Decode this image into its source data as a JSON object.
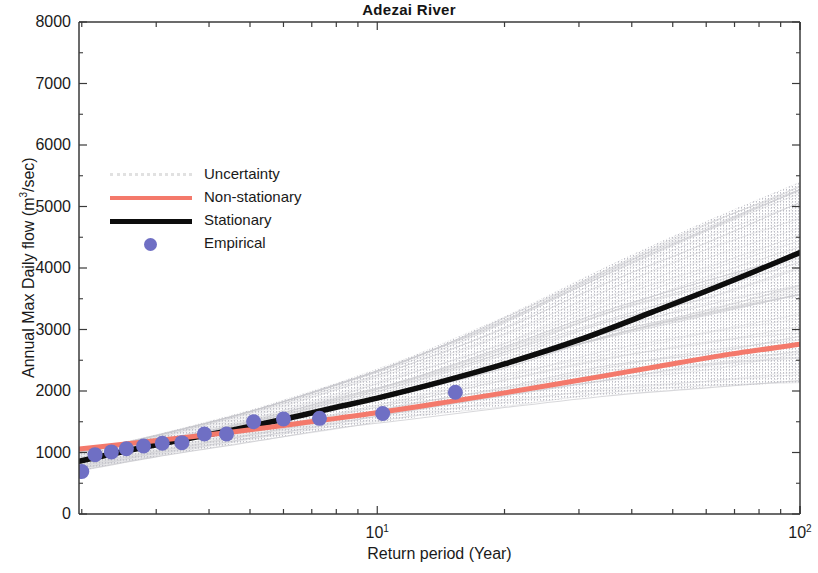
{
  "chart_data": {
    "type": "line",
    "title": "Adezai  River",
    "xlabel": "Return period (Year)",
    "ylabel_parts": {
      "pre": "Annual Max  Daily flow (m",
      "sup": "3",
      "post": "/sec)"
    },
    "ylabel": "Annual Max  Daily flow (m3/sec)",
    "xscale": "log",
    "yscale": "linear",
    "xlim": [
      1.97,
      100
    ],
    "ylim": [
      0,
      8000
    ],
    "ytick_labels": [
      "8000",
      "7000",
      "6000",
      "5000",
      "4000",
      "3000",
      "2000",
      "1000",
      "0"
    ],
    "ytick_values": [
      8000,
      7000,
      6000,
      5000,
      4000,
      3000,
      2000,
      1000,
      0
    ],
    "xtick_labels": [
      "10",
      "10"
    ],
    "xtick_exponents": [
      "1",
      "2"
    ],
    "xtick_values": [
      10,
      100
    ],
    "grid": false,
    "legend_position": "upper left inside",
    "legend": [
      {
        "label": "Uncertainty",
        "style": "stipple",
        "color": "#c9c9c9"
      },
      {
        "label": "Non-stationary",
        "style": "line",
        "color": "#f4796b"
      },
      {
        "label": "Stationary",
        "style": "line",
        "color": "#0d0d0d"
      },
      {
        "label": "Empirical",
        "style": "marker",
        "color": "#6f6fc4"
      }
    ],
    "colors": {
      "non_stationary": "#f4796b",
      "stationary": "#0d0d0d",
      "empirical": "#6f6fc4",
      "uncertainty": "#c7c7cc",
      "axis": "#3a3a3a",
      "text": "#1a1a1a"
    },
    "series": [
      {
        "name": "Non-stationary",
        "type": "line",
        "color": "#f4796b",
        "x": [
          1.97,
          2.3,
          2.8,
          3.5,
          4.5,
          6,
          8,
          10,
          14,
          20,
          30,
          45,
          65,
          100
        ],
        "y": [
          1055,
          1105,
          1170,
          1245,
          1330,
          1440,
          1555,
          1645,
          1800,
          1970,
          2175,
          2385,
          2575,
          2760
        ]
      },
      {
        "name": "Stationary",
        "type": "line",
        "color": "#0d0d0d",
        "x": [
          1.97,
          2.3,
          2.8,
          3.5,
          4.5,
          6,
          8,
          10,
          14,
          20,
          30,
          45,
          65,
          100
        ],
        "y": [
          855,
          960,
          1085,
          1215,
          1360,
          1540,
          1735,
          1885,
          2140,
          2440,
          2830,
          3290,
          3720,
          4250
        ]
      },
      {
        "name": "Empirical",
        "type": "scatter",
        "color": "#6f6fc4",
        "x": [
          2.0,
          2.15,
          2.35,
          2.55,
          2.8,
          3.1,
          3.45,
          3.9,
          4.4,
          5.1,
          6.0,
          7.3,
          10.3,
          15.3
        ],
        "y": [
          690,
          965,
          1010,
          1060,
          1105,
          1150,
          1160,
          1300,
          1300,
          1500,
          1545,
          1555,
          1635,
          1980
        ]
      },
      {
        "name": "Uncertainty",
        "type": "band",
        "color": "#c7c7cc",
        "x": [
          1.97,
          3,
          5,
          8,
          12,
          20,
          35,
          60,
          100
        ],
        "y_lower": [
          700,
          930,
          1180,
          1390,
          1560,
          1760,
          1940,
          2060,
          2140
        ],
        "y_upper": [
          1010,
          1290,
          1690,
          2130,
          2560,
          3210,
          4030,
          4760,
          5400
        ]
      }
    ],
    "annotations": []
  }
}
